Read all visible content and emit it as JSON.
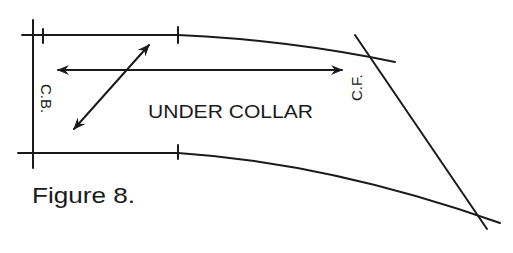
{
  "diagram": {
    "title": "UNDER COLLAR",
    "caption": "Figure 8.",
    "labels": {
      "center_back": "C.B.",
      "center_front": "C.F."
    },
    "elements": [
      {
        "type": "line",
        "name": "center-back-line",
        "desc": "vertical line at left edge"
      },
      {
        "type": "curve",
        "name": "upper-edge",
        "desc": "top seam line curving down to the right"
      },
      {
        "type": "curve",
        "name": "lower-edge",
        "desc": "bottom seam line curving down to the right"
      },
      {
        "type": "line",
        "name": "center-front-line",
        "desc": "diagonal line crossing both edges at right"
      },
      {
        "type": "double-arrow",
        "name": "lengthwise-grain",
        "desc": "horizontal double arrow"
      },
      {
        "type": "double-arrow",
        "name": "bias-grain",
        "desc": "diagonal double arrow"
      },
      {
        "type": "tick",
        "name": "notch-marks",
        "desc": "short notch ticks on upper and lower edges"
      }
    ]
  },
  "colors": {
    "ink": "#1a1a1a",
    "background": "#ffffff"
  }
}
